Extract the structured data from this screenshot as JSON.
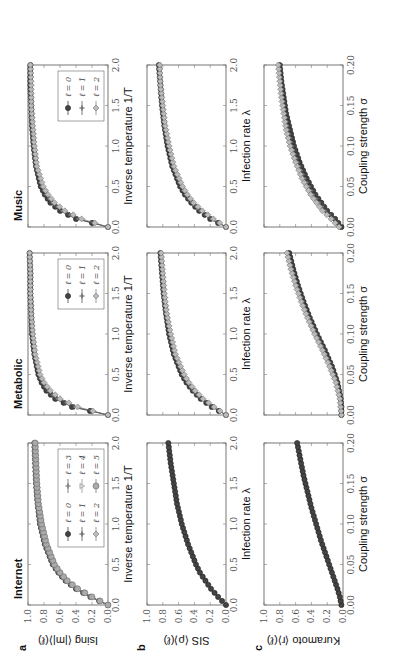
{
  "figure": {
    "rotation_deg": -90,
    "columns": [
      "Internet",
      "Metabolic",
      "Music"
    ],
    "rows": [
      {
        "letter": "a",
        "ylabel": "Ising ⟨|m|⟩(ℓ)",
        "xlabel": "Inverse temperature 1/T"
      },
      {
        "letter": "b",
        "ylabel": "SIS ⟨ρ⟩(ℓ)",
        "xlabel": "Infection rate λ"
      },
      {
        "letter": "c",
        "ylabel": "Kuramoto ⟨r⟩(ℓ)",
        "xlabel": "Coupling strength σ"
      }
    ],
    "y_ticks": [
      "0.0",
      "0.2",
      "0.4",
      "0.6",
      "0.8",
      "1.0"
    ],
    "x_ticks_temp": [
      "0.0",
      "0.5",
      "1.0",
      "1.5",
      "2.0"
    ],
    "x_ticks_infection": [
      "0.0",
      "0.5",
      "1.0",
      "1.5",
      "2.0"
    ],
    "x_ticks_coupling": [
      "0.00",
      "0.05",
      "0.10",
      "0.15",
      "0.20"
    ],
    "legends": {
      "Internet": [
        "ℓ = 0",
        "ℓ = 1",
        "ℓ = 2",
        "ℓ = 3",
        "ℓ = 4",
        "ℓ = 5"
      ],
      "Metabolic": [
        "ℓ = 0",
        "ℓ = 1",
        "ℓ = 2"
      ],
      "Music": [
        "ℓ = 0",
        "ℓ = 1",
        "ℓ = 2"
      ]
    }
  },
  "chart_data": [
    {
      "type": "line",
      "panel": "a",
      "column": "Internet",
      "title": "Internet",
      "xlabel": "Inverse temperature 1/T",
      "ylabel": "Ising ⟨|m|⟩(ℓ)",
      "xlim": [
        0,
        2
      ],
      "ylim": [
        0,
        1
      ],
      "x": [
        0.0,
        0.1,
        0.2,
        0.3,
        0.4,
        0.5,
        0.75,
        1.0,
        1.25,
        1.5,
        1.75,
        2.0
      ],
      "series": [
        {
          "name": "ℓ = 0",
          "values": [
            0.0,
            0.22,
            0.4,
            0.53,
            0.62,
            0.69,
            0.79,
            0.85,
            0.88,
            0.9,
            0.91,
            0.92
          ]
        },
        {
          "name": "ℓ = 1",
          "values": [
            0.0,
            0.22,
            0.4,
            0.53,
            0.62,
            0.69,
            0.79,
            0.85,
            0.88,
            0.9,
            0.91,
            0.92
          ]
        },
        {
          "name": "ℓ = 2",
          "values": [
            0.0,
            0.21,
            0.39,
            0.52,
            0.61,
            0.68,
            0.78,
            0.84,
            0.87,
            0.89,
            0.91,
            0.92
          ]
        },
        {
          "name": "ℓ = 3",
          "values": [
            0.0,
            0.21,
            0.39,
            0.52,
            0.61,
            0.68,
            0.78,
            0.84,
            0.87,
            0.89,
            0.91,
            0.92
          ]
        },
        {
          "name": "ℓ = 4",
          "values": [
            0.0,
            0.21,
            0.38,
            0.51,
            0.6,
            0.67,
            0.78,
            0.84,
            0.87,
            0.89,
            0.9,
            0.91
          ]
        },
        {
          "name": "ℓ = 5",
          "values": [
            0.0,
            0.2,
            0.38,
            0.51,
            0.6,
            0.67,
            0.77,
            0.83,
            0.87,
            0.89,
            0.9,
            0.91
          ]
        }
      ],
      "legend_position": "lower right"
    },
    {
      "type": "line",
      "panel": "a",
      "column": "Metabolic",
      "title": "Metabolic",
      "xlabel": "Inverse temperature 1/T",
      "ylabel": "Ising ⟨|m|⟩(ℓ)",
      "xlim": [
        0,
        2
      ],
      "ylim": [
        0,
        1
      ],
      "x": [
        0.0,
        0.1,
        0.2,
        0.3,
        0.4,
        0.5,
        0.75,
        1.0,
        1.25,
        1.5,
        1.75,
        2.0
      ],
      "series": [
        {
          "name": "ℓ = 0",
          "values": [
            0.0,
            0.45,
            0.66,
            0.77,
            0.83,
            0.87,
            0.92,
            0.95,
            0.96,
            0.97,
            0.97,
            0.98
          ]
        },
        {
          "name": "ℓ = 1",
          "values": [
            0.0,
            0.42,
            0.64,
            0.75,
            0.82,
            0.86,
            0.92,
            0.94,
            0.96,
            0.97,
            0.97,
            0.98
          ]
        },
        {
          "name": "ℓ = 2",
          "values": [
            0.0,
            0.38,
            0.6,
            0.72,
            0.8,
            0.85,
            0.91,
            0.94,
            0.96,
            0.97,
            0.97,
            0.98
          ]
        }
      ],
      "legend_position": "lower right"
    },
    {
      "type": "line",
      "panel": "a",
      "column": "Music",
      "title": "Music",
      "xlabel": "Inverse temperature 1/T",
      "ylabel": "Ising ⟨|m|⟩(ℓ)",
      "xlim": [
        0,
        2
      ],
      "ylim": [
        0,
        1
      ],
      "x": [
        0.0,
        0.1,
        0.2,
        0.3,
        0.4,
        0.5,
        0.75,
        1.0,
        1.25,
        1.5,
        1.75,
        2.0
      ],
      "series": [
        {
          "name": "ℓ = 0",
          "values": [
            0.0,
            0.4,
            0.6,
            0.72,
            0.79,
            0.84,
            0.9,
            0.93,
            0.95,
            0.96,
            0.97,
            0.97
          ]
        },
        {
          "name": "ℓ = 1",
          "values": [
            0.0,
            0.38,
            0.58,
            0.7,
            0.78,
            0.83,
            0.9,
            0.93,
            0.95,
            0.96,
            0.97,
            0.97
          ]
        },
        {
          "name": "ℓ = 2",
          "values": [
            0.0,
            0.33,
            0.54,
            0.67,
            0.75,
            0.81,
            0.89,
            0.92,
            0.94,
            0.96,
            0.96,
            0.97
          ]
        }
      ],
      "legend_position": "lower right"
    },
    {
      "type": "line",
      "panel": "b",
      "column": "Internet",
      "xlabel": "Infection rate λ",
      "ylabel": "SIS ⟨ρ⟩(ℓ)",
      "xlim": [
        0,
        2
      ],
      "ylim": [
        0,
        1
      ],
      "x": [
        0.0,
        0.1,
        0.2,
        0.3,
        0.4,
        0.5,
        0.75,
        1.0,
        1.25,
        1.5,
        1.75,
        2.0
      ],
      "series": [
        {
          "name": "ℓ = 0..5",
          "values": [
            0.0,
            0.1,
            0.19,
            0.26,
            0.33,
            0.38,
            0.48,
            0.56,
            0.62,
            0.66,
            0.7,
            0.73
          ]
        }
      ]
    },
    {
      "type": "line",
      "panel": "b",
      "column": "Metabolic",
      "xlabel": "Infection rate λ",
      "ylabel": "SIS ⟨ρ⟩(ℓ)",
      "xlim": [
        0,
        2
      ],
      "ylim": [
        0,
        1
      ],
      "x": [
        0.0,
        0.1,
        0.2,
        0.3,
        0.4,
        0.5,
        0.75,
        1.0,
        1.25,
        1.5,
        1.75,
        2.0
      ],
      "series": [
        {
          "name": "ℓ = 0",
          "values": [
            0.0,
            0.18,
            0.32,
            0.42,
            0.5,
            0.56,
            0.66,
            0.72,
            0.76,
            0.79,
            0.81,
            0.83
          ]
        },
        {
          "name": "ℓ = 1",
          "values": [
            0.0,
            0.17,
            0.31,
            0.41,
            0.49,
            0.55,
            0.65,
            0.71,
            0.75,
            0.78,
            0.81,
            0.83
          ]
        },
        {
          "name": "ℓ = 2",
          "values": [
            0.0,
            0.15,
            0.29,
            0.39,
            0.47,
            0.53,
            0.64,
            0.7,
            0.75,
            0.78,
            0.8,
            0.82
          ]
        }
      ]
    },
    {
      "type": "line",
      "panel": "b",
      "column": "Music",
      "xlabel": "Infection rate λ",
      "ylabel": "SIS ⟨ρ⟩(ℓ)",
      "xlim": [
        0,
        2
      ],
      "ylim": [
        0,
        1
      ],
      "x": [
        0.0,
        0.1,
        0.2,
        0.3,
        0.4,
        0.5,
        0.75,
        1.0,
        1.25,
        1.5,
        1.75,
        2.0
      ],
      "series": [
        {
          "name": "ℓ = 0",
          "values": [
            0.0,
            0.2,
            0.34,
            0.44,
            0.52,
            0.58,
            0.68,
            0.74,
            0.78,
            0.81,
            0.83,
            0.85
          ]
        },
        {
          "name": "ℓ = 1",
          "values": [
            0.0,
            0.19,
            0.33,
            0.43,
            0.51,
            0.57,
            0.67,
            0.73,
            0.78,
            0.81,
            0.83,
            0.85
          ]
        },
        {
          "name": "ℓ = 2",
          "values": [
            0.0,
            0.16,
            0.3,
            0.41,
            0.49,
            0.55,
            0.66,
            0.72,
            0.77,
            0.8,
            0.83,
            0.84
          ]
        }
      ]
    },
    {
      "type": "line",
      "panel": "c",
      "column": "Internet",
      "xlabel": "Coupling strength σ",
      "ylabel": "Kuramoto ⟨r⟩(ℓ)",
      "xlim": [
        0,
        0.2
      ],
      "ylim": [
        0,
        1
      ],
      "x": [
        0.0,
        0.01,
        0.02,
        0.04,
        0.06,
        0.08,
        0.1,
        0.12,
        0.14,
        0.16,
        0.18,
        0.2
      ],
      "series": [
        {
          "name": "ℓ = 0..5",
          "values": [
            0.02,
            0.04,
            0.07,
            0.14,
            0.21,
            0.28,
            0.34,
            0.4,
            0.45,
            0.5,
            0.54,
            0.58
          ]
        }
      ]
    },
    {
      "type": "line",
      "panel": "c",
      "column": "Metabolic",
      "xlabel": "Coupling strength σ",
      "ylabel": "Kuramoto ⟨r⟩(ℓ)",
      "xlim": [
        0,
        0.2
      ],
      "ylim": [
        0,
        1
      ],
      "x": [
        0.0,
        0.01,
        0.02,
        0.04,
        0.06,
        0.08,
        0.1,
        0.12,
        0.14,
        0.16,
        0.18,
        0.2
      ],
      "series": [
        {
          "name": "ℓ = 0",
          "values": [
            0.02,
            0.02,
            0.03,
            0.07,
            0.14,
            0.23,
            0.33,
            0.42,
            0.5,
            0.57,
            0.63,
            0.68
          ]
        },
        {
          "name": "ℓ = 1",
          "values": [
            0.02,
            0.02,
            0.03,
            0.08,
            0.15,
            0.24,
            0.34,
            0.43,
            0.51,
            0.58,
            0.64,
            0.69
          ]
        },
        {
          "name": "ℓ = 2",
          "values": [
            0.02,
            0.03,
            0.04,
            0.09,
            0.17,
            0.26,
            0.36,
            0.45,
            0.53,
            0.6,
            0.66,
            0.71
          ]
        }
      ]
    },
    {
      "type": "line",
      "panel": "c",
      "column": "Music",
      "xlabel": "Coupling strength σ",
      "ylabel": "Kuramoto ⟨r⟩(ℓ)",
      "xlim": [
        0,
        0.2
      ],
      "ylim": [
        0,
        1
      ],
      "x": [
        0.0,
        0.01,
        0.02,
        0.04,
        0.06,
        0.08,
        0.1,
        0.12,
        0.14,
        0.16,
        0.18,
        0.2
      ],
      "series": [
        {
          "name": "ℓ = 0",
          "values": [
            0.02,
            0.1,
            0.2,
            0.35,
            0.46,
            0.55,
            0.62,
            0.67,
            0.72,
            0.75,
            0.78,
            0.8
          ]
        },
        {
          "name": "ℓ = 1",
          "values": [
            0.03,
            0.12,
            0.22,
            0.37,
            0.48,
            0.57,
            0.64,
            0.69,
            0.73,
            0.76,
            0.79,
            0.81
          ]
        },
        {
          "name": "ℓ = 2",
          "values": [
            0.05,
            0.15,
            0.26,
            0.41,
            0.52,
            0.6,
            0.67,
            0.72,
            0.75,
            0.78,
            0.8,
            0.82
          ]
        }
      ]
    }
  ]
}
